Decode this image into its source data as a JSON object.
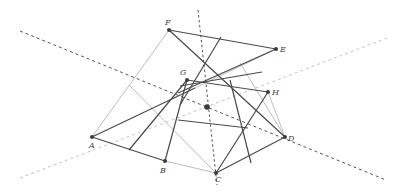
{
  "diagram": {
    "colors": {
      "dark": "#4a4a4a",
      "light": "#bdbdbd",
      "dash": "#555555",
      "dot_light": "#c4c4c4",
      "point": "#3a3a3a"
    },
    "points": {
      "A": {
        "label": "A",
        "x": 92,
        "y": 137
      },
      "B": {
        "label": "B",
        "x": 165,
        "y": 161
      },
      "C": {
        "label": "C",
        "x": 216,
        "y": 173
      },
      "D": {
        "label": "D",
        "x": 285,
        "y": 137
      },
      "E": {
        "label": "E",
        "x": 276,
        "y": 49
      },
      "F": {
        "label": "F",
        "x": 169,
        "y": 30
      },
      "G": {
        "label": "G",
        "x": 187,
        "y": 80
      },
      "H": {
        "label": "H",
        "x": 268,
        "y": 92
      },
      "O": {
        "label": "",
        "x": 207,
        "y": 107
      }
    },
    "labels": {
      "A": "A",
      "B": "B",
      "C": "C",
      "D": "D",
      "E": "E",
      "F": "F",
      "G": "G",
      "H": "H"
    }
  }
}
